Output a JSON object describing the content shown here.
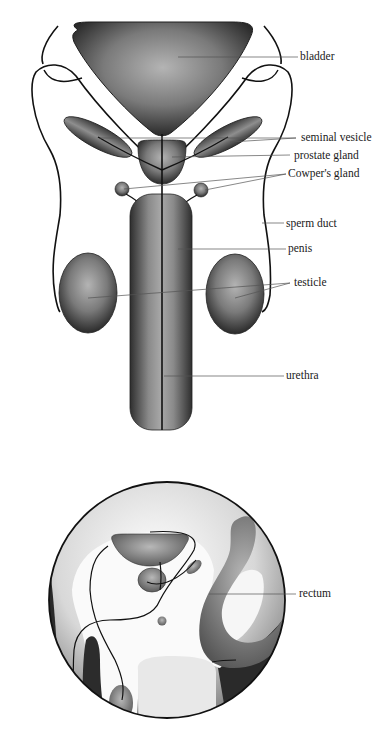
{
  "diagram": {
    "front_view": {
      "labels": [
        {
          "id": "bladder",
          "text": "bladder",
          "x": 300,
          "y": 52
        },
        {
          "id": "seminal-vesicle",
          "text": "seminal vesicle",
          "x": 300,
          "y": 132
        },
        {
          "id": "prostate-gland",
          "text": "prostate gland",
          "x": 294,
          "y": 150
        },
        {
          "id": "cowpers-gland",
          "text": "Cowper's gland",
          "x": 288,
          "y": 169
        },
        {
          "id": "sperm-duct",
          "text": "sperm duct",
          "x": 286,
          "y": 218
        },
        {
          "id": "penis",
          "text": "penis",
          "x": 288,
          "y": 243
        },
        {
          "id": "testicle",
          "text": "testicle",
          "x": 294,
          "y": 277
        },
        {
          "id": "urethra",
          "text": "urethra",
          "x": 286,
          "y": 369
        }
      ]
    },
    "side_view": {
      "labels": [
        {
          "id": "rectum",
          "text": "rectum",
          "x": 300,
          "y": 594
        }
      ]
    },
    "colors": {
      "outline": "#111111",
      "organ_dark": "#2e2e2e",
      "organ_light": "#a8a8a8",
      "leader_line": "#555555",
      "background": "#ffffff"
    }
  }
}
